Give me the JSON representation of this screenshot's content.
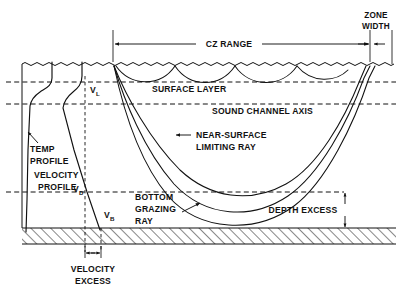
{
  "diagram": {
    "labels": {
      "cz_range": "CZ RANGE",
      "zone_width_line1": "ZONE",
      "zone_width_line2": "WIDTH",
      "surface_layer": "SURFACE  LAYER",
      "sound_channel_axis": "SOUND CHANNEL AXIS",
      "near_surface_line1": "NEAR-SURFACE",
      "near_surface_line2": "LIMITING RAY",
      "bottom_grazing_line1": "BOTTOM",
      "bottom_grazing_line2": "GRAZING",
      "bottom_grazing_line3": "RAY",
      "depth_excess": "DEPTH EXCESS",
      "temp_profile_line1": "TEMP",
      "temp_profile_line2": "PROFILE",
      "velocity_profile_line1": "VELOCITY",
      "velocity_profile_line2": "PROFILE",
      "velocity_excess_line1": "VELOCITY",
      "velocity_excess_line2": "EXCESS",
      "v_l_main": "V",
      "v_l_sub": "L",
      "v_d_main": "V",
      "v_d_sub": "D",
      "v_b_main": "V",
      "v_b_sub": "B"
    },
    "colors": {
      "ink": "#111111",
      "background": "#ffffff"
    },
    "geometry": {
      "surface_y": 64,
      "surface_layer_y": 82,
      "sound_channel_axis_y": 104,
      "depth_excess_y": 192,
      "seafloor_top_y": 228,
      "seafloor_bottom_y": 244,
      "left_axis_x": 22,
      "source_x": 113,
      "cz_start_x": 113,
      "cz_end_x": 370,
      "zone_right_x": 392
    }
  }
}
